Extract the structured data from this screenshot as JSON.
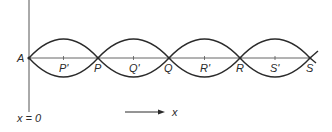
{
  "diagram": {
    "type": "standing-wave",
    "axis": {
      "origin_label": "x = 0",
      "direction_label": "x"
    },
    "nodes": [
      {
        "label": "A",
        "x": 29
      },
      {
        "label": "P",
        "x": 98
      },
      {
        "label": "Q",
        "x": 169
      },
      {
        "label": "R",
        "x": 240
      },
      {
        "label": "S",
        "x": 310
      }
    ],
    "antinodes": [
      {
        "label": "P'"
      },
      {
        "label": "Q'"
      },
      {
        "label": "R'"
      },
      {
        "label": "S'"
      }
    ],
    "colors": {
      "line": "#2a2a2a",
      "axis_line": "#555555",
      "background": "#ffffff"
    }
  }
}
